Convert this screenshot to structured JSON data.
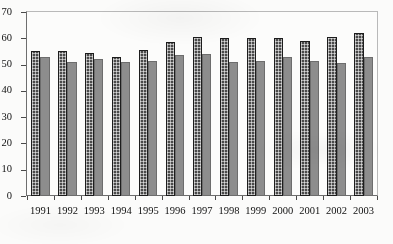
{
  "chart_data": {
    "type": "bar",
    "title": "",
    "xlabel": "",
    "ylabel": "",
    "ylim": [
      0,
      70
    ],
    "ytick_step": 10,
    "grid": false,
    "legend": "none",
    "categories": [
      "1991",
      "1992",
      "1993",
      "1994",
      "1995",
      "1996",
      "1997",
      "1998",
      "1999",
      "2000",
      "2001",
      "2002",
      "2003"
    ],
    "ytick_labels": [
      "70",
      "60",
      "50",
      "40",
      "30",
      "20",
      "10",
      "0"
    ],
    "series": [
      {
        "name": "series-1",
        "color": "#4a4a4a",
        "pattern": "cross-hatch-dots",
        "values": [
          55,
          55,
          54.5,
          53,
          55.5,
          58.5,
          60.5,
          60,
          60,
          60,
          59,
          60.5,
          62
        ]
      },
      {
        "name": "series-2",
        "color": "#8d8d8d",
        "pattern": "solid",
        "values": [
          53,
          51,
          52,
          51,
          51.5,
          53.5,
          54,
          51,
          51.5,
          53,
          51.5,
          50.5,
          53
        ]
      }
    ]
  },
  "colors": {
    "background": "#fbfbfa",
    "plot_background": "#fcfcfb",
    "axis": "#4a4a4a",
    "frame_light": "#b9b9b9",
    "series_1": "#4a4a4a",
    "series_2": "#8d8d8d",
    "text": "#111111"
  }
}
